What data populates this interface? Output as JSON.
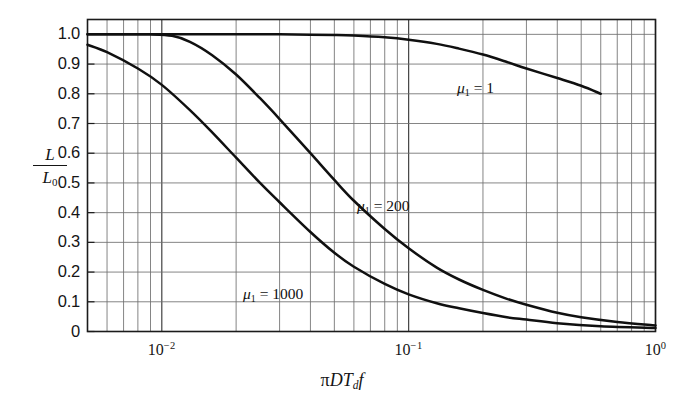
{
  "figure": {
    "background_color": "#ffffff",
    "ink_color": "#151515",
    "grid_color": "#6f6f6f"
  },
  "axes": {
    "y_label_numerator": "L",
    "y_label_denominator": "L",
    "y_label_denominator_sub": "0",
    "x_label_pi": "π",
    "x_label_D": "D",
    "x_label_T": "T",
    "x_label_T_sub": "d",
    "x_label_f": "f",
    "y_ticks": [
      "1.0",
      "0.9",
      "0.8",
      "0.7",
      "0.6",
      "0.5",
      "0.4",
      "0.3",
      "0.2",
      "0.1",
      "0"
    ],
    "x_tick_labels": [
      {
        "mantissa": "10",
        "exponent": "−2",
        "value": 0.01
      },
      {
        "mantissa": "10",
        "exponent": "−1",
        "value": 0.1
      },
      {
        "mantissa": "10",
        "exponent": "0",
        "value": 1.0
      }
    ]
  },
  "curve_labels": [
    {
      "id": "mu1-1",
      "mu": "μ",
      "sub": "1",
      "eq": " = 1",
      "x": 457,
      "y": 79
    },
    {
      "id": "mu1-200",
      "mu": "μ",
      "sub": "1",
      "eq": " = 200",
      "x": 357,
      "y": 197
    },
    {
      "id": "mu1-1000",
      "mu": "μ",
      "sub": "1",
      "eq": " = 1000",
      "x": 243,
      "y": 285
    }
  ],
  "chart_data": {
    "type": "line",
    "title": "",
    "xlabel": "πDT_d f",
    "ylabel": "L/L_0",
    "xscale": "log",
    "yscale": "linear",
    "xlim": [
      0.005,
      1.0
    ],
    "ylim": [
      0,
      1.05
    ],
    "grid": true,
    "legend": "inline-annotations",
    "xticks": [
      0.01,
      0.1,
      1.0
    ],
    "xticklabels": [
      "10^-2",
      "10^-1",
      "10^0"
    ],
    "yticks": [
      0,
      0.1,
      0.2,
      0.3,
      0.4,
      0.5,
      0.6,
      0.7,
      0.8,
      0.9,
      1.0
    ],
    "yticklabels": [
      "0",
      "0.1",
      "0.2",
      "0.3",
      "0.4",
      "0.5",
      "0.6",
      "0.7",
      "0.8",
      "0.9",
      "1.0"
    ],
    "series": [
      {
        "name": "μ1 = 1",
        "label": "μ₁ = 1",
        "x": [
          0.005,
          0.007,
          0.01,
          0.015,
          0.02,
          0.03,
          0.04,
          0.05,
          0.06,
          0.08,
          0.1,
          0.13,
          0.16,
          0.2,
          0.25,
          0.3,
          0.4,
          0.5,
          0.6
        ],
        "y": [
          1.0,
          1.0,
          1.0,
          1.0,
          1.0,
          1.0,
          0.999,
          0.998,
          0.996,
          0.99,
          0.982,
          0.968,
          0.952,
          0.932,
          0.907,
          0.885,
          0.853,
          0.827,
          0.8
        ]
      },
      {
        "name": "μ1 = 200",
        "label": "μ₁ = 200",
        "x": [
          0.005,
          0.007,
          0.009,
          0.011,
          0.013,
          0.016,
          0.02,
          0.025,
          0.03,
          0.04,
          0.05,
          0.06,
          0.08,
          0.1,
          0.13,
          0.16,
          0.2,
          0.25,
          0.3,
          0.4,
          0.5,
          0.7,
          1.0
        ],
        "y": [
          1.0,
          1.0,
          1.0,
          0.995,
          0.975,
          0.93,
          0.865,
          0.785,
          0.715,
          0.6,
          0.51,
          0.44,
          0.345,
          0.28,
          0.215,
          0.175,
          0.14,
          0.11,
          0.09,
          0.063,
          0.048,
          0.032,
          0.02
        ]
      },
      {
        "name": "μ1 = 1000",
        "label": "μ₁ = 1000",
        "x": [
          0.005,
          0.006,
          0.008,
          0.01,
          0.013,
          0.016,
          0.02,
          0.025,
          0.03,
          0.04,
          0.05,
          0.06,
          0.08,
          0.1,
          0.13,
          0.16,
          0.2,
          0.25,
          0.3,
          0.4,
          0.6,
          1.0
        ],
        "y": [
          0.965,
          0.94,
          0.885,
          0.83,
          0.745,
          0.67,
          0.585,
          0.5,
          0.435,
          0.335,
          0.265,
          0.218,
          0.16,
          0.125,
          0.095,
          0.078,
          0.062,
          0.048,
          0.04,
          0.028,
          0.018,
          0.012
        ]
      }
    ]
  }
}
